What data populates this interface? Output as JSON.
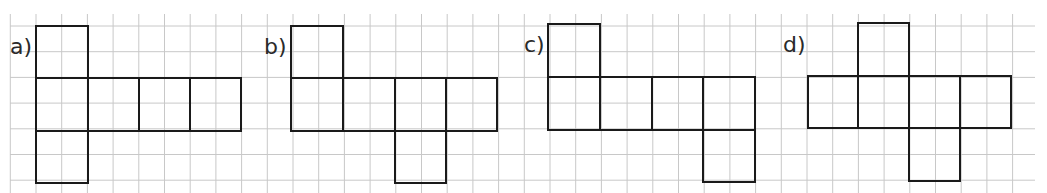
{
  "grid": {
    "x0": 10,
    "x1": 1035,
    "y0": 14,
    "y1": 193,
    "step": 25.7,
    "color": "#c8c8c8"
  },
  "stroke_color": "#1a1a1a",
  "nets": [
    {
      "label": "a)",
      "label_pos": [
        10,
        36
      ],
      "squares": [
        [
          36,
          26,
          52,
          52
        ],
        [
          36,
          78,
          52,
          53
        ],
        [
          88,
          78,
          51,
          53
        ],
        [
          139,
          78,
          51,
          53
        ],
        [
          190,
          78,
          51,
          53
        ],
        [
          36,
          131,
          52,
          52
        ]
      ]
    },
    {
      "label": "b)",
      "label_pos": [
        264,
        36
      ],
      "squares": [
        [
          291,
          26,
          52,
          52
        ],
        [
          291,
          78,
          52,
          53
        ],
        [
          343,
          78,
          52,
          53
        ],
        [
          395,
          78,
          51,
          53
        ],
        [
          446,
          78,
          51,
          53
        ],
        [
          395,
          131,
          51,
          52
        ]
      ]
    },
    {
      "label": "c)",
      "label_pos": [
        524,
        34
      ],
      "squares": [
        [
          548,
          24,
          52,
          53
        ],
        [
          548,
          77,
          52,
          53
        ],
        [
          600,
          77,
          52,
          53
        ],
        [
          652,
          77,
          51,
          53
        ],
        [
          703,
          77,
          52,
          53
        ],
        [
          703,
          130,
          52,
          52
        ]
      ]
    },
    {
      "label": "d)",
      "label_pos": [
        783,
        34
      ],
      "squares": [
        [
          858,
          23,
          51,
          53
        ],
        [
          808,
          76,
          50,
          52
        ],
        [
          858,
          76,
          51,
          52
        ],
        [
          909,
          76,
          51,
          52
        ],
        [
          960,
          76,
          51,
          52
        ],
        [
          909,
          128,
          51,
          53
        ]
      ]
    }
  ]
}
